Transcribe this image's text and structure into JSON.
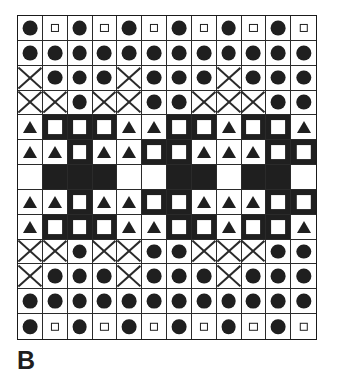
{
  "figure": {
    "caption": "B",
    "grid": {
      "columns": 12,
      "rows": 13,
      "background_color": "#ffffff",
      "ink_color": "#1f1f1f",
      "border_color": "#2a2a2a"
    },
    "legend": {
      "circle": "filled-circle",
      "square_small": "open-square",
      "square_big": "white-square-on-black",
      "triangle": "filled-triangle",
      "cross": "diagonal-cross",
      "blank": "empty"
    }
  },
  "chart_data": {
    "type": "heatmap",
    "title": "B",
    "xlabel": "",
    "ylabel": "",
    "columns": 12,
    "rows": 13,
    "symbol_key": {
      "C": "filled-circle",
      "s": "small-open-square",
      "S": "large-white-square",
      "T": "filled-triangle",
      "X": "diagonal-cross",
      ".": "blank"
    },
    "background_key": {
      "w": "white",
      "b": "black"
    },
    "cells": [
      [
        {
          "sym": "C",
          "bg": "w"
        },
        {
          "sym": "s",
          "bg": "w"
        },
        {
          "sym": "C",
          "bg": "w"
        },
        {
          "sym": "s",
          "bg": "w"
        },
        {
          "sym": "C",
          "bg": "w"
        },
        {
          "sym": "s",
          "bg": "w"
        },
        {
          "sym": "C",
          "bg": "w"
        },
        {
          "sym": "s",
          "bg": "w"
        },
        {
          "sym": "C",
          "bg": "w"
        },
        {
          "sym": "s",
          "bg": "w"
        },
        {
          "sym": "C",
          "bg": "w"
        },
        {
          "sym": "s",
          "bg": "w"
        }
      ],
      [
        {
          "sym": "C",
          "bg": "w"
        },
        {
          "sym": "C",
          "bg": "w"
        },
        {
          "sym": "C",
          "bg": "w"
        },
        {
          "sym": "C",
          "bg": "w"
        },
        {
          "sym": "C",
          "bg": "w"
        },
        {
          "sym": "C",
          "bg": "w"
        },
        {
          "sym": "C",
          "bg": "w"
        },
        {
          "sym": "C",
          "bg": "w"
        },
        {
          "sym": "C",
          "bg": "w"
        },
        {
          "sym": "C",
          "bg": "w"
        },
        {
          "sym": "C",
          "bg": "w"
        },
        {
          "sym": "C",
          "bg": "w"
        }
      ],
      [
        {
          "sym": "X",
          "bg": "w"
        },
        {
          "sym": "C",
          "bg": "w"
        },
        {
          "sym": "C",
          "bg": "w"
        },
        {
          "sym": "C",
          "bg": "w"
        },
        {
          "sym": "X",
          "bg": "w"
        },
        {
          "sym": "C",
          "bg": "w"
        },
        {
          "sym": "C",
          "bg": "w"
        },
        {
          "sym": "C",
          "bg": "w"
        },
        {
          "sym": "X",
          "bg": "w"
        },
        {
          "sym": "C",
          "bg": "w"
        },
        {
          "sym": "C",
          "bg": "w"
        },
        {
          "sym": "C",
          "bg": "w"
        }
      ],
      [
        {
          "sym": "X",
          "bg": "w"
        },
        {
          "sym": "X",
          "bg": "w"
        },
        {
          "sym": "C",
          "bg": "w"
        },
        {
          "sym": "X",
          "bg": "w"
        },
        {
          "sym": "X",
          "bg": "w"
        },
        {
          "sym": "C",
          "bg": "w"
        },
        {
          "sym": "C",
          "bg": "w"
        },
        {
          "sym": "X",
          "bg": "w"
        },
        {
          "sym": "X",
          "bg": "w"
        },
        {
          "sym": "X",
          "bg": "w"
        },
        {
          "sym": "C",
          "bg": "w"
        },
        {
          "sym": "C",
          "bg": "w"
        }
      ],
      [
        {
          "sym": "T",
          "bg": "w"
        },
        {
          "sym": "S",
          "bg": "b"
        },
        {
          "sym": "S",
          "bg": "b"
        },
        {
          "sym": "S",
          "bg": "b"
        },
        {
          "sym": "T",
          "bg": "w"
        },
        {
          "sym": "T",
          "bg": "w"
        },
        {
          "sym": "S",
          "bg": "b"
        },
        {
          "sym": "S",
          "bg": "b"
        },
        {
          "sym": "T",
          "bg": "w"
        },
        {
          "sym": "S",
          "bg": "b"
        },
        {
          "sym": "S",
          "bg": "b"
        },
        {
          "sym": "T",
          "bg": "w"
        }
      ],
      [
        {
          "sym": "T",
          "bg": "w"
        },
        {
          "sym": "T",
          "bg": "w"
        },
        {
          "sym": "S",
          "bg": "b"
        },
        {
          "sym": "T",
          "bg": "w"
        },
        {
          "sym": "T",
          "bg": "w"
        },
        {
          "sym": "S",
          "bg": "b"
        },
        {
          "sym": "S",
          "bg": "b"
        },
        {
          "sym": "T",
          "bg": "w"
        },
        {
          "sym": "T",
          "bg": "w"
        },
        {
          "sym": "T",
          "bg": "w"
        },
        {
          "sym": "S",
          "bg": "b"
        },
        {
          "sym": "S",
          "bg": "b"
        }
      ],
      [
        {
          "sym": ".",
          "bg": "w"
        },
        {
          "sym": ".",
          "bg": "b"
        },
        {
          "sym": ".",
          "bg": "b"
        },
        {
          "sym": ".",
          "bg": "b"
        },
        {
          "sym": ".",
          "bg": "w"
        },
        {
          "sym": ".",
          "bg": "w"
        },
        {
          "sym": ".",
          "bg": "b"
        },
        {
          "sym": ".",
          "bg": "b"
        },
        {
          "sym": ".",
          "bg": "w"
        },
        {
          "sym": ".",
          "bg": "b"
        },
        {
          "sym": ".",
          "bg": "b"
        },
        {
          "sym": ".",
          "bg": "w"
        }
      ],
      [
        {
          "sym": "T",
          "bg": "w"
        },
        {
          "sym": "T",
          "bg": "w"
        },
        {
          "sym": "S",
          "bg": "b"
        },
        {
          "sym": "T",
          "bg": "w"
        },
        {
          "sym": "T",
          "bg": "w"
        },
        {
          "sym": "S",
          "bg": "b"
        },
        {
          "sym": "S",
          "bg": "b"
        },
        {
          "sym": "T",
          "bg": "w"
        },
        {
          "sym": "T",
          "bg": "w"
        },
        {
          "sym": "T",
          "bg": "w"
        },
        {
          "sym": "S",
          "bg": "b"
        },
        {
          "sym": "S",
          "bg": "b"
        }
      ],
      [
        {
          "sym": "T",
          "bg": "w"
        },
        {
          "sym": "S",
          "bg": "b"
        },
        {
          "sym": "S",
          "bg": "b"
        },
        {
          "sym": "S",
          "bg": "b"
        },
        {
          "sym": "T",
          "bg": "w"
        },
        {
          "sym": "T",
          "bg": "w"
        },
        {
          "sym": "S",
          "bg": "b"
        },
        {
          "sym": "S",
          "bg": "b"
        },
        {
          "sym": "T",
          "bg": "w"
        },
        {
          "sym": "S",
          "bg": "b"
        },
        {
          "sym": "S",
          "bg": "b"
        },
        {
          "sym": "T",
          "bg": "w"
        }
      ],
      [
        {
          "sym": "X",
          "bg": "w"
        },
        {
          "sym": "X",
          "bg": "w"
        },
        {
          "sym": "C",
          "bg": "w"
        },
        {
          "sym": "X",
          "bg": "w"
        },
        {
          "sym": "X",
          "bg": "w"
        },
        {
          "sym": "C",
          "bg": "w"
        },
        {
          "sym": "C",
          "bg": "w"
        },
        {
          "sym": "X",
          "bg": "w"
        },
        {
          "sym": "X",
          "bg": "w"
        },
        {
          "sym": "X",
          "bg": "w"
        },
        {
          "sym": "C",
          "bg": "w"
        },
        {
          "sym": "C",
          "bg": "w"
        }
      ],
      [
        {
          "sym": "X",
          "bg": "w"
        },
        {
          "sym": "C",
          "bg": "w"
        },
        {
          "sym": "C",
          "bg": "w"
        },
        {
          "sym": "C",
          "bg": "w"
        },
        {
          "sym": "X",
          "bg": "w"
        },
        {
          "sym": "C",
          "bg": "w"
        },
        {
          "sym": "C",
          "bg": "w"
        },
        {
          "sym": "C",
          "bg": "w"
        },
        {
          "sym": "X",
          "bg": "w"
        },
        {
          "sym": "C",
          "bg": "w"
        },
        {
          "sym": "C",
          "bg": "w"
        },
        {
          "sym": "C",
          "bg": "w"
        }
      ],
      [
        {
          "sym": "C",
          "bg": "w"
        },
        {
          "sym": "C",
          "bg": "w"
        },
        {
          "sym": "C",
          "bg": "w"
        },
        {
          "sym": "C",
          "bg": "w"
        },
        {
          "sym": "C",
          "bg": "w"
        },
        {
          "sym": "C",
          "bg": "w"
        },
        {
          "sym": "C",
          "bg": "w"
        },
        {
          "sym": "C",
          "bg": "w"
        },
        {
          "sym": "C",
          "bg": "w"
        },
        {
          "sym": "C",
          "bg": "w"
        },
        {
          "sym": "C",
          "bg": "w"
        },
        {
          "sym": "C",
          "bg": "w"
        }
      ],
      [
        {
          "sym": "C",
          "bg": "w"
        },
        {
          "sym": "s",
          "bg": "w"
        },
        {
          "sym": "C",
          "bg": "w"
        },
        {
          "sym": "s",
          "bg": "w"
        },
        {
          "sym": "C",
          "bg": "w"
        },
        {
          "sym": "s",
          "bg": "w"
        },
        {
          "sym": "C",
          "bg": "w"
        },
        {
          "sym": "s",
          "bg": "w"
        },
        {
          "sym": "C",
          "bg": "w"
        },
        {
          "sym": "s",
          "bg": "w"
        },
        {
          "sym": "C",
          "bg": "w"
        },
        {
          "sym": "s",
          "bg": "w"
        }
      ]
    ]
  }
}
